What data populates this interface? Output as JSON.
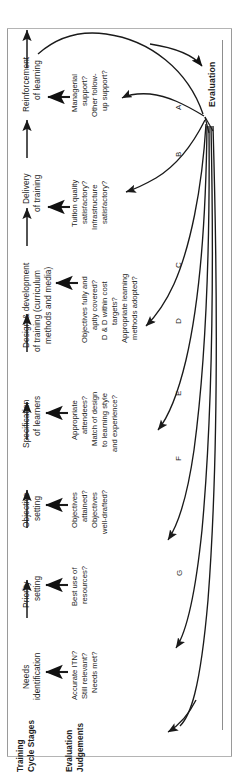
{
  "figure": {
    "orientation": "rotated-90-ccw",
    "colors": {
      "ink": "#1a1a1a",
      "background": "#ffffff",
      "border": "#8d8d8d"
    }
  },
  "row_headers": {
    "stages_label": "Training\nCycle Stages",
    "stages_label_line1": "Training",
    "stages_label_line2": "Cycle Stages",
    "judgements_label_line1": "Evaluation",
    "judgements_label_line2": "Judgements"
  },
  "evaluation_node": {
    "label": "Evaluation"
  },
  "stages": [
    {
      "id": "needs-identification",
      "line1": "Needs",
      "line2": "identification",
      "judgements": [
        "Accurate ITN?",
        "Still relevant?",
        "Needs met?"
      ],
      "curve": "G"
    },
    {
      "id": "priority-setting",
      "line1": "Priority",
      "line2": "setting",
      "judgements": [
        "Best use of",
        "resources?"
      ],
      "curve": "F"
    },
    {
      "id": "objective-setting",
      "line1": "Objective",
      "line2": "setting",
      "judgements": [
        "Objectives",
        "attained?",
        "Objectives",
        "well-drafted?"
      ],
      "curve": "E"
    },
    {
      "id": "specification-of-learners",
      "line1": "Specification",
      "line2": "of learners",
      "judgements": [
        "Appropriate",
        "attendees?",
        "Match of design",
        "to learning style",
        "and experience?"
      ],
      "curve": "D"
    },
    {
      "id": "design-and-development",
      "line1": "Design & development",
      "line2": "of training (curriculum",
      "line3": "methods and media)",
      "judgements": [
        "Objectives fully and",
        "aptly covered?",
        "D & D within cost",
        "targets?",
        "Appropriate learning",
        "methods adopted?"
      ],
      "curve": "C"
    },
    {
      "id": "delivery-of-training",
      "line1": "Delivery",
      "line2": "of training",
      "judgements": [
        "Tuition quality",
        "satisfactory?",
        "Infrastructure",
        "satisfactory?"
      ],
      "curve": "B"
    },
    {
      "id": "reinforcement-of-learning",
      "line1": "Reinforcement",
      "line2": "of learning",
      "judgements": [
        "Managerial",
        "support?",
        "Other follow-",
        "up support?"
      ],
      "curve": "A"
    }
  ],
  "curve_labels": [
    "A",
    "B",
    "C",
    "D",
    "E",
    "F",
    "G"
  ]
}
